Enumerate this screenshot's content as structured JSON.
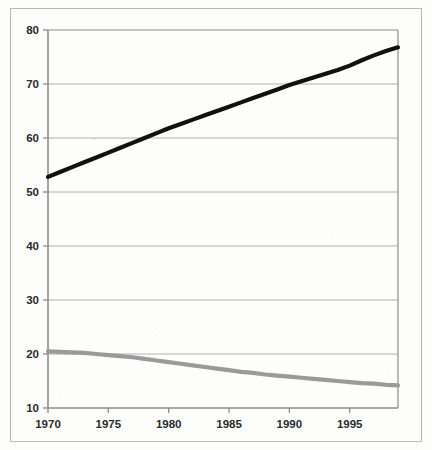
{
  "chart_data": {
    "type": "line",
    "title": "",
    "subtitle": "",
    "xlabel": "",
    "ylabel": "",
    "xlim": [
      1970,
      1999
    ],
    "ylim": [
      10,
      80
    ],
    "grid": true,
    "legend": "none",
    "x_ticks": [
      "1970",
      "1975",
      "1980",
      "1985",
      "1990",
      "1995"
    ],
    "x_tick_values": [
      1970,
      1975,
      1980,
      1985,
      1990,
      1995
    ],
    "y_ticks": [
      "10",
      "20",
      "30",
      "40",
      "50",
      "60",
      "70",
      "80"
    ],
    "y_tick_values": [
      10,
      20,
      30,
      40,
      50,
      60,
      70,
      80
    ],
    "x": [
      1970,
      1971,
      1972,
      1973,
      1974,
      1975,
      1976,
      1977,
      1978,
      1979,
      1980,
      1981,
      1982,
      1983,
      1984,
      1985,
      1986,
      1987,
      1988,
      1989,
      1990,
      1991,
      1992,
      1993,
      1994,
      1995,
      1996,
      1997,
      1998,
      1999
    ],
    "series": [
      {
        "name": "upper-series",
        "color": "#111111",
        "width": 4.2,
        "values": [
          52.8,
          53.7,
          54.6,
          55.5,
          56.4,
          57.3,
          58.2,
          59.1,
          60.0,
          60.9,
          61.8,
          62.6,
          63.4,
          64.2,
          65.0,
          65.8,
          66.6,
          67.4,
          68.2,
          69.0,
          69.8,
          70.5,
          71.2,
          71.9,
          72.6,
          73.4,
          74.4,
          75.3,
          76.1,
          76.8
        ]
      },
      {
        "name": "lower-series",
        "color": "#9a9a9a",
        "width": 4.2,
        "values": [
          20.5,
          20.4,
          20.3,
          20.2,
          20.0,
          19.8,
          19.6,
          19.4,
          19.1,
          18.8,
          18.5,
          18.2,
          17.9,
          17.6,
          17.3,
          17.0,
          16.7,
          16.5,
          16.2,
          16.0,
          15.8,
          15.6,
          15.4,
          15.2,
          15.0,
          14.8,
          14.6,
          14.5,
          14.3,
          14.2
        ]
      }
    ]
  },
  "plot": {
    "left": 48,
    "right": 398,
    "top": 30,
    "bottom": 408,
    "axis_color": "#8c8c8c",
    "grid_color": "#b0b0b0",
    "frame_color": "#b9b9b9"
  }
}
